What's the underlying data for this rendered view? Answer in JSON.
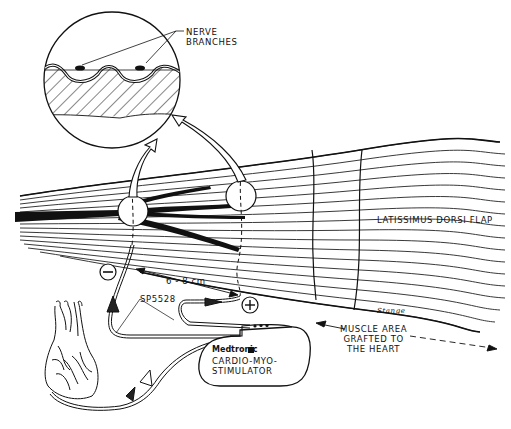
{
  "diagram": {
    "type": "medical illustration",
    "labels": {
      "nerve_branches": "NERVE\nBRANCHES",
      "muscle_flap": "LATISSIMUS DORSI FLAP",
      "distance": "6 - 8 cm",
      "lead_model": "SP5528",
      "negative_electrode": "−",
      "positive_electrode": "+",
      "device_brand": "Medtronic",
      "device_name": "CARDIO-MYO-\nSTIMULATOR",
      "grafted_area": "MUSCLE AREA\nGRAFTED TO\nTHE HEART",
      "signature": "Stange"
    },
    "components": [
      "magnified-cross-section-inset",
      "latissimus-dorsi-muscle",
      "neurovascular-pedicle",
      "negative-electrode",
      "positive-electrode",
      "intramuscular-leads",
      "cardio-myo-stimulator",
      "heart",
      "epicardial-sensing-lead"
    ],
    "colors": {
      "ink": "#111111",
      "background": "#ffffff"
    }
  }
}
